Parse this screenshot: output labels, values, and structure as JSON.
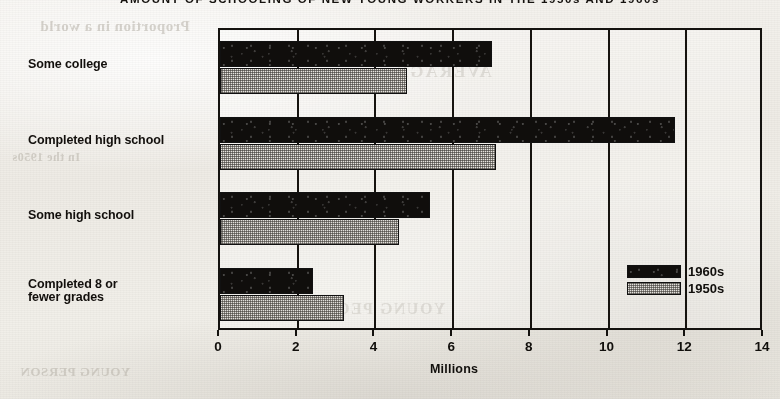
{
  "chart_data": {
    "type": "bar",
    "orientation": "horizontal",
    "title": "AMOUNT OF SCHOOLING OF NEW YOUNG WORKERS IN THE 1950s AND 1960s",
    "xlabel": "Millions",
    "ylabel": "",
    "xlim": [
      0,
      14
    ],
    "xticks": [
      0,
      2,
      4,
      6,
      8,
      10,
      12,
      14
    ],
    "xtick_labels": [
      "0",
      "2",
      "4",
      "6",
      "8",
      "10",
      "12",
      "14"
    ],
    "grid": true,
    "grid_axis": "x",
    "legend_position": "inside-lower-right",
    "categories": [
      "Some college",
      "Completed high school",
      "Some high school",
      "Completed 8 or fewer grades"
    ],
    "category_label_lines": [
      [
        "Some college"
      ],
      [
        "Completed high school"
      ],
      [
        "Some high school"
      ],
      [
        "Completed 8 or",
        "fewer grades"
      ]
    ],
    "series": [
      {
        "name": "1960s",
        "color": "#100e0c",
        "fill": "solid-black",
        "values": [
          7.0,
          11.7,
          5.4,
          2.4
        ]
      },
      {
        "name": "1950s",
        "color": "#d8d5cf",
        "fill": "stipple-gray",
        "values": [
          4.8,
          7.1,
          4.6,
          3.2
        ]
      }
    ]
  },
  "legend": {
    "items": [
      {
        "label": "1960s",
        "swatch": "black-solid"
      },
      {
        "label": "1950s",
        "swatch": "gray-stipple"
      }
    ]
  },
  "background": {
    "ghost_text": [
      "Proportion in a world",
      "AVERAGE",
      "YOUNG PERSON",
      "In the 1950s",
      "YOUNG PEOPLE",
      "proportion"
    ]
  },
  "colors": {
    "paper": "#f1efe9",
    "ink": "#14120f",
    "series_1960s": "#100e0c",
    "series_1950s": "#d8d5cf"
  }
}
